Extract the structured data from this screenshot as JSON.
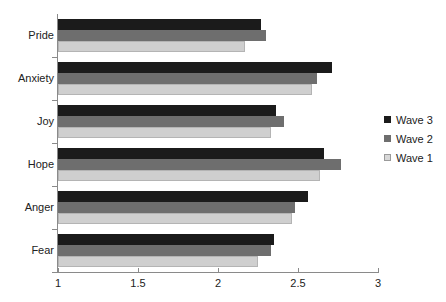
{
  "chart_data": {
    "type": "bar",
    "orientation": "horizontal",
    "title": "",
    "xlabel": "",
    "ylabel": "",
    "xlim": [
      1,
      3
    ],
    "xticks": [
      1,
      1.5,
      2,
      2.5,
      3
    ],
    "xtick_labels": [
      "1",
      "1.5",
      "2",
      "2.5",
      "3"
    ],
    "grid": false,
    "legend_position": "right",
    "categories": [
      "Pride",
      "Anxiety",
      "Joy",
      "Hope",
      "Anger",
      "Fear"
    ],
    "series": [
      {
        "name": "Wave 3",
        "color": "#1b1b1b",
        "values": [
          2.27,
          2.71,
          2.36,
          2.66,
          2.56,
          2.35
        ]
      },
      {
        "name": "Wave 2",
        "color": "#6e6e6e",
        "values": [
          2.3,
          2.62,
          2.41,
          2.77,
          2.48,
          2.33
        ]
      },
      {
        "name": "Wave 1",
        "color": "#cfcfcf",
        "values": [
          2.17,
          2.59,
          2.33,
          2.64,
          2.46,
          2.25
        ]
      }
    ]
  },
  "axis": {
    "axis_color": "#8a8a8a",
    "tick_label_color": "#222222"
  }
}
